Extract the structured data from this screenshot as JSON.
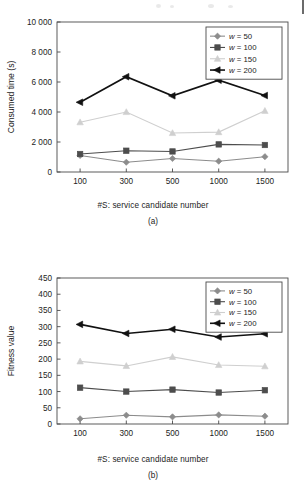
{
  "figure_a": {
    "caption": "(a)",
    "chart_data": {
      "type": "line",
      "title": "",
      "xlabel": "#S: service candidate number",
      "ylabel": "Consumed time (s)",
      "categories": [
        "100",
        "300",
        "500",
        "1000",
        "1500"
      ],
      "ylim": [
        0,
        10000
      ],
      "yticks": [
        "0",
        "2 000",
        "4 000",
        "6 000",
        "8 000",
        "10 000"
      ],
      "ytick_values": [
        0,
        2000,
        4000,
        6000,
        8000,
        10000
      ],
      "grid": false,
      "legend_position": "top-right",
      "series": [
        {
          "name": "w = 50",
          "marker": "diamond",
          "color": "#8c8c8c",
          "values": [
            1100,
            650,
            900,
            720,
            1020
          ]
        },
        {
          "name": "w = 100",
          "marker": "square",
          "color": "#4d4d4d",
          "values": [
            1200,
            1420,
            1370,
            1840,
            1800
          ]
        },
        {
          "name": "w = 150",
          "marker": "triangle-up",
          "color": "#cfcfcf",
          "values": [
            3320,
            4000,
            2600,
            2660,
            4080
          ]
        },
        {
          "name": "w = 200",
          "marker": "triangle-left",
          "color": "#111111",
          "values": [
            4650,
            6350,
            5080,
            6120,
            5100
          ]
        }
      ]
    }
  },
  "figure_b": {
    "caption": "(b)",
    "chart_data": {
      "type": "line",
      "title": "",
      "xlabel": "#S: service candidate number",
      "ylabel": "Fitness value",
      "categories": [
        "100",
        "300",
        "500",
        "1000",
        "1500"
      ],
      "ylim": [
        0,
        450
      ],
      "yticks": [
        "0",
        "50",
        "100",
        "150",
        "200",
        "250",
        "300",
        "350",
        "400",
        "450"
      ],
      "ytick_values": [
        0,
        50,
        100,
        150,
        200,
        250,
        300,
        350,
        400,
        450
      ],
      "grid": false,
      "legend_position": "top-right",
      "series": [
        {
          "name": "w = 50",
          "marker": "diamond",
          "color": "#8c8c8c",
          "values": [
            16,
            27,
            22,
            28,
            24
          ]
        },
        {
          "name": "w = 100",
          "marker": "square",
          "color": "#4d4d4d",
          "values": [
            112,
            100,
            106,
            97,
            104
          ]
        },
        {
          "name": "w = 150",
          "marker": "triangle-up",
          "color": "#cfcfcf",
          "values": [
            193,
            179,
            207,
            182,
            178
          ]
        },
        {
          "name": "w = 200",
          "marker": "triangle-left",
          "color": "#111111",
          "values": [
            307,
            279,
            292,
            268,
            278
          ]
        }
      ]
    }
  }
}
